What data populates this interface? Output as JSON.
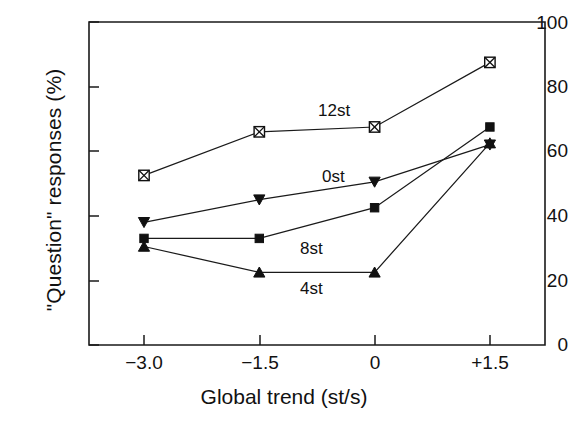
{
  "chart_data": {
    "type": "line",
    "title": "",
    "xlabel": "Global trend (st/s)",
    "ylabel": "\"Question\" responses (%)",
    "categories": [
      "-3.0",
      "-1.5",
      "0",
      "+1.5"
    ],
    "x": [
      -3.0,
      -1.5,
      0,
      1.5
    ],
    "xtick_labels": [
      "−3.0",
      "−1.5",
      "0",
      "+1.5"
    ],
    "ytick_labels": [
      "0",
      "20",
      "40",
      "60",
      "80",
      "100"
    ],
    "yticks": [
      0,
      20,
      40,
      60,
      80,
      100
    ],
    "ylim": [
      0,
      100
    ],
    "grid": false,
    "legend_position": "inline-annotations",
    "series": [
      {
        "name": "12st",
        "marker": "crossed-square",
        "values": [
          52.5,
          66.0,
          67.5,
          87.5
        ],
        "label_x": 1.0,
        "label_y": 75.0
      },
      {
        "name": "0st",
        "marker": "triangle-down",
        "values": [
          38.0,
          45.0,
          50.5,
          62.0
        ],
        "label_x": 1.0,
        "label_y": 55.5
      },
      {
        "name": "8st",
        "marker": "filled-square",
        "values": [
          33.0,
          33.0,
          42.5,
          67.5
        ],
        "label_x": 1.0,
        "label_y": 33.5
      },
      {
        "name": "4st",
        "marker": "triangle-up",
        "values": [
          30.5,
          22.5,
          22.5,
          62.5
        ],
        "label_x": 1.0,
        "label_y": 26.0
      }
    ],
    "annotations": [
      {
        "text": "12st",
        "x": 318,
        "y": 112
      },
      {
        "text": "0st",
        "x": 322,
        "y": 178
      },
      {
        "text": "8st",
        "x": 300,
        "y": 250
      },
      {
        "text": "4st",
        "x": 300,
        "y": 290
      }
    ]
  },
  "axis": {
    "ylabel_text": "\"Question\" responses (%)",
    "xlabel_text": "Global trend (st/s)"
  }
}
